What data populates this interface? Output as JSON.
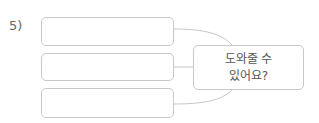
{
  "question": {
    "number_label": "5)",
    "answer_boxes": [
      {
        "value": ""
      },
      {
        "value": ""
      },
      {
        "value": ""
      }
    ],
    "center_box": {
      "line1": "도와줄 수",
      "line2": "있어요?"
    },
    "colors": {
      "border": "#c8c8c8",
      "text": "#555555"
    }
  }
}
